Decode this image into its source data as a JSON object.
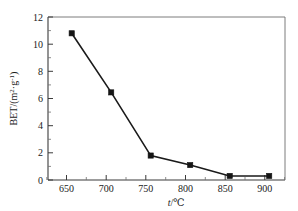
{
  "chart_data": {
    "type": "line",
    "title": "",
    "xlabel": "t/℃",
    "ylabel": "BET/(m²·g⁻¹)",
    "x": [
      650,
      700,
      750,
      800,
      850,
      900
    ],
    "values": [
      10.8,
      6.45,
      1.8,
      1.1,
      0.3,
      0.3
    ],
    "series": [
      {
        "name": "BET",
        "values": [
          10.8,
          6.45,
          1.8,
          1.1,
          0.3,
          0.3
        ]
      }
    ],
    "xlim": [
      620,
      920
    ],
    "ylim": [
      0,
      12
    ],
    "x_ticks": [
      650,
      700,
      750,
      800,
      850,
      900
    ],
    "y_ticks": [
      0,
      2,
      4,
      6,
      8,
      10,
      12
    ],
    "x_tick_labels": [
      "650",
      "700",
      "750",
      "800",
      "850",
      "900"
    ],
    "y_tick_labels": [
      "0",
      "2",
      "4",
      "6",
      "8",
      "10",
      "12"
    ],
    "x_minor_per_interval": 1,
    "y_minor_per_interval": 1,
    "grid": false,
    "legend": false,
    "marker": "square",
    "marker_color": "#151515",
    "line_color": "#1a1a1a",
    "frame_color": "#6e6e6e",
    "background": "#ffffff"
  },
  "axis": {
    "y_label_main": "BET/(m",
    "y_label_sup1": "2",
    "y_label_mid": "·g",
    "y_label_sup2": "-1",
    "y_label_close": ")",
    "x_label_var": "t",
    "x_label_unit": "/℃"
  }
}
